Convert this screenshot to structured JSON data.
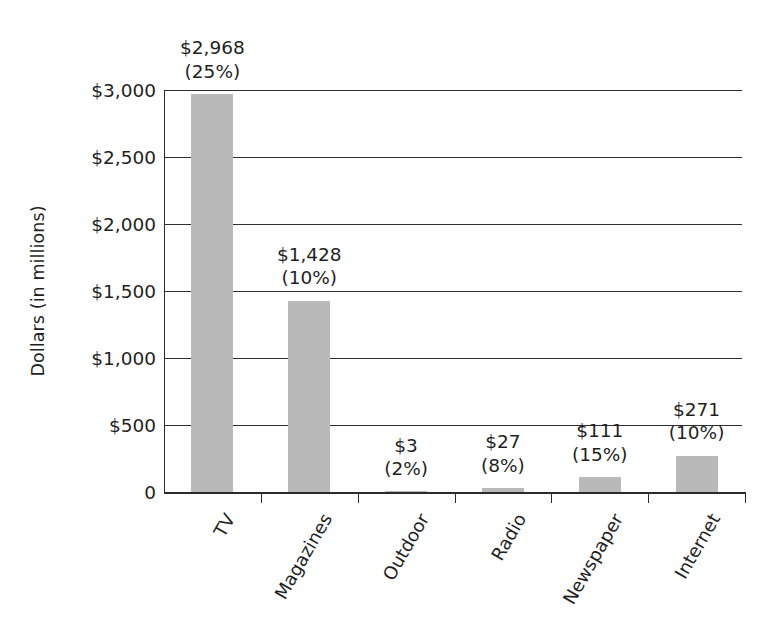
{
  "chart_data": {
    "type": "bar",
    "title": "",
    "subtitle": "",
    "xlabel": "",
    "ylabel": "Dollars (in millions)",
    "categories": [
      "TV",
      "Magazines",
      "Outdoor",
      "Radio",
      "Newspaper",
      "Internet"
    ],
    "values": [
      2968,
      1428,
      3,
      27,
      111,
      271
    ],
    "value_labels": [
      "$2,968",
      "$1,428",
      "$3",
      "$27",
      "$111",
      "$271"
    ],
    "percent_labels": [
      "(25%)",
      "(10%)",
      "(2%)",
      "(8%)",
      "(15%)",
      "(10%)"
    ],
    "percents": [
      25,
      10,
      2,
      8,
      15,
      10
    ],
    "ylim": [
      0,
      3000
    ],
    "ytick_values": [
      3000,
      2500,
      2000,
      1500,
      1000,
      500,
      0
    ],
    "ytick_labels": [
      "$3,000",
      "$2,500",
      "$2,000",
      "$1,500",
      "$1,000",
      "$500",
      "0"
    ],
    "grid": true,
    "grid_axis": "y",
    "legend": "none",
    "bar_color": "#b9b9b9",
    "axis_color": "#2b2b2b",
    "background_color": "#ffffff"
  }
}
